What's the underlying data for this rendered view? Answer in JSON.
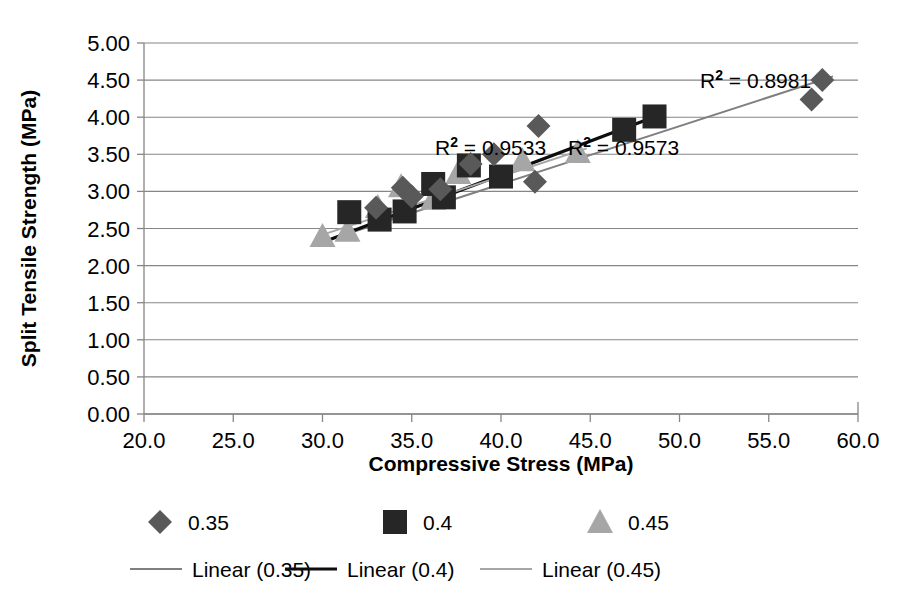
{
  "chart_data": {
    "type": "scatter",
    "title": "",
    "xlabel": "Compressive Stress (MPa)",
    "ylabel": "Split Tensile Strength (MPa)",
    "xlim": [
      20.0,
      60.0
    ],
    "ylim": [
      0.0,
      5.0
    ],
    "xticks": [
      "20.0",
      "25.0",
      "30.0",
      "35.0",
      "40.0",
      "45.0",
      "50.0",
      "55.0",
      "60.0"
    ],
    "yticks": [
      "0.00",
      "0.50",
      "1.00",
      "1.50",
      "2.00",
      "2.50",
      "3.00",
      "3.50",
      "4.00",
      "4.50",
      "5.00"
    ],
    "grid": "horizontal",
    "legend_position": "bottom",
    "series": [
      {
        "name": "0.35",
        "marker": "diamond",
        "color": "#595959",
        "points": [
          [
            34.5,
            3.05
          ],
          [
            36.6,
            3.03
          ],
          [
            38.3,
            3.37
          ],
          [
            39.6,
            3.5
          ],
          [
            42.1,
            3.88
          ],
          [
            41.9,
            3.13
          ],
          [
            57.4,
            4.24
          ],
          [
            58.0,
            4.5
          ],
          [
            33.0,
            2.78
          ],
          [
            35.0,
            2.93
          ]
        ],
        "trendline": {
          "name": "Linear (0.35)",
          "color": "#7f7f7f",
          "r2_label": "R² = 0.8981",
          "r2_value": 0.8981,
          "x_from": 30.0,
          "y_from": 2.32,
          "x_to": 58.6,
          "y_to": 4.55
        }
      },
      {
        "name": "0.4",
        "marker": "square",
        "color": "#262626",
        "points": [
          [
            31.5,
            2.72
          ],
          [
            33.2,
            2.62
          ],
          [
            34.6,
            2.73
          ],
          [
            36.2,
            3.1
          ],
          [
            38.2,
            3.35
          ],
          [
            36.8,
            2.92
          ],
          [
            46.9,
            3.83
          ],
          [
            48.6,
            4.01
          ],
          [
            40.0,
            3.2
          ]
        ],
        "trendline": {
          "name": "Linear (0.4)",
          "color": "#0d0d0d",
          "r2_label": "R² = 0.9573",
          "r2_value": 0.9573,
          "x_from": 30.2,
          "y_from": 2.33,
          "x_to": 49.2,
          "y_to": 4.06
        }
      },
      {
        "name": "0.45",
        "marker": "triangle",
        "color": "#a6a6a6",
        "points": [
          [
            30.0,
            2.4
          ],
          [
            31.4,
            2.47
          ],
          [
            33.1,
            2.79
          ],
          [
            34.4,
            3.07
          ],
          [
            37.6,
            3.25
          ],
          [
            41.2,
            3.42
          ],
          [
            44.3,
            3.53
          ],
          [
            36.2,
            2.9
          ]
        ],
        "trendline": {
          "name": "Linear (0.45)",
          "color": "#a6a6a6",
          "r2_label": "R² = 0.9533",
          "r2_value": 0.9533,
          "x_from": 29.8,
          "y_from": 2.4,
          "x_to": 44.8,
          "y_to": 3.58
        }
      }
    ],
    "annotations": [
      {
        "text_full": "R² = 0.8981",
        "base": "R",
        "sup": "2",
        "rest": " = 0.8981",
        "x_px": 700,
        "y_px": 88
      },
      {
        "text_full": "R² = 0.9533",
        "base": "R",
        "sup": "2",
        "rest": " = 0.9533",
        "x_px": 435,
        "y_px": 155
      },
      {
        "text_full": "R² = 0.9573",
        "base": "R",
        "sup": "2",
        "rest": " = 0.9573",
        "x_px": 568,
        "y_px": 155
      }
    ],
    "legend": {
      "markers": [
        {
          "label": "0.35",
          "shape": "diamond",
          "color": "#595959"
        },
        {
          "label": "0.4",
          "shape": "square",
          "color": "#262626"
        },
        {
          "label": "0.45",
          "shape": "triangle",
          "color": "#a6a6a6"
        }
      ],
      "lines": [
        {
          "label": "Linear (0.35)",
          "color": "#7f7f7f"
        },
        {
          "label": "Linear (0.4)",
          "color": "#0d0d0d"
        },
        {
          "label": "Linear (0.45)",
          "color": "#a6a6a6"
        }
      ]
    }
  }
}
